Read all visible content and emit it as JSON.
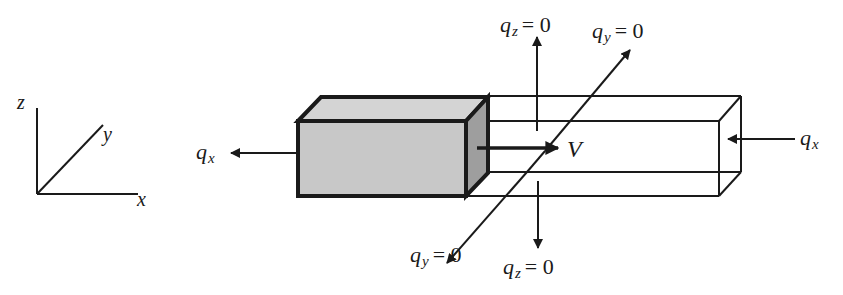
{
  "diagram": {
    "type": "3D flow channel schematic",
    "colors": {
      "line": "#1a1a1a",
      "block_front": "#c8c8c8",
      "block_top": "#d4d4d4",
      "block_side": "#9e9e9e",
      "background": "#ffffff"
    },
    "axes": {
      "z_label": "z",
      "y_label": "y",
      "x_label": "x"
    },
    "block": {
      "description": "shaded solid block moving with velocity V inside open rectangular channel"
    },
    "velocity": {
      "symbol": "V"
    },
    "fluxes": {
      "qx_left": {
        "symbol": "q",
        "subscript": "x",
        "value": ""
      },
      "qx_right": {
        "symbol": "q",
        "subscript": "x",
        "value": ""
      },
      "qz_top": {
        "symbol": "q",
        "subscript": "z",
        "value": "= 0"
      },
      "qz_bottom": {
        "symbol": "q",
        "subscript": "z",
        "value": "= 0"
      },
      "qy_top": {
        "symbol": "q",
        "subscript": "y",
        "value": "= 0"
      },
      "qy_bottom": {
        "symbol": "q",
        "subscript": "y",
        "value": "= 0"
      }
    }
  }
}
